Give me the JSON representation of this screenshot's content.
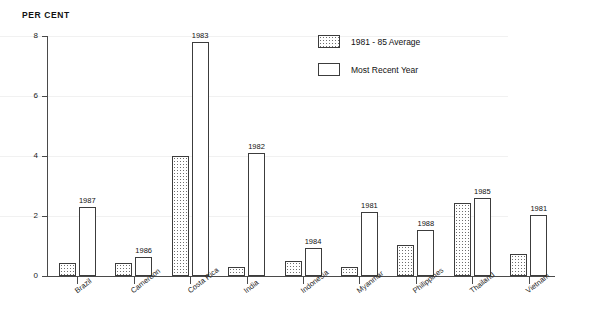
{
  "chart_data": {
    "type": "bar",
    "title": "",
    "ylabel": "PER CENT",
    "xlabel": "",
    "ylim": [
      0,
      8
    ],
    "yticks": [
      0,
      2,
      4,
      6,
      8
    ],
    "grid": true,
    "legend_position": "top-right",
    "categories": [
      "Brazil",
      "Cameroon",
      "Costa Rica",
      "India",
      "Indonesia",
      "Myanmar",
      "Philippines",
      "Thailand",
      "Vietnam"
    ],
    "series": [
      {
        "name": "1981 - 85 Average",
        "values": [
          0.45,
          0.42,
          4.0,
          0.3,
          0.5,
          0.3,
          1.05,
          2.45,
          0.75
        ]
      },
      {
        "name": "Most Recent Year",
        "values": [
          2.3,
          0.62,
          7.8,
          4.1,
          0.95,
          2.15,
          1.55,
          2.6,
          2.05
        ],
        "point_labels": [
          "1987",
          "1986",
          "1983",
          "1982",
          "1984",
          "1981",
          "1988",
          "1985",
          "1981"
        ]
      }
    ]
  },
  "legend": {
    "items": [
      {
        "label": "1981 - 85 Average",
        "style": "dotted-fill"
      },
      {
        "label": "Most Recent Year",
        "style": "empty-fill"
      }
    ]
  },
  "axis": {
    "y_title": "PER CENT",
    "y_labels": [
      "8",
      "6",
      "4",
      "2",
      "0"
    ]
  }
}
